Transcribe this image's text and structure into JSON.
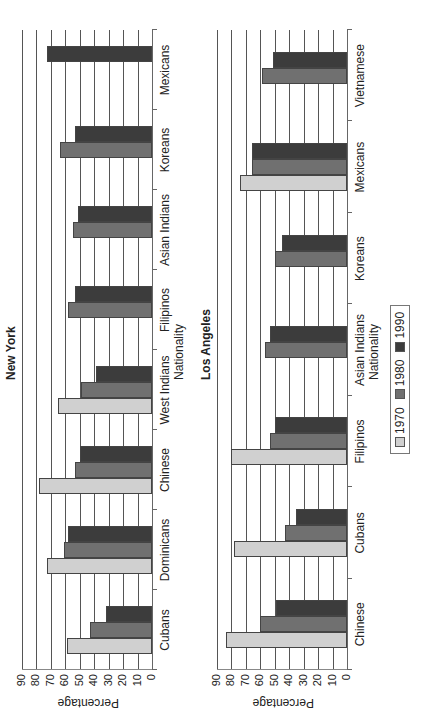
{
  "chart_data": [
    {
      "type": "bar",
      "orientation": "vertical (image rotated 90° counter-clockwise)",
      "title": "New York",
      "xlabel": "Nationality",
      "ylabel": "Percentage",
      "ylim": [
        0,
        90
      ],
      "yticks": [
        0,
        10,
        20,
        30,
        40,
        50,
        60,
        70,
        80,
        90
      ],
      "grid": true,
      "categories": [
        "Cubans",
        "Dominicans",
        "Chinese",
        "West Indians",
        "Filipinos",
        "Asian Indians",
        "Koreans",
        "Mexicans"
      ],
      "series": [
        {
          "name": "1970",
          "color": "#d0d0d0",
          "values": [
            59,
            73,
            78,
            65,
            null,
            null,
            null,
            null
          ]
        },
        {
          "name": "1980",
          "color": "#707070",
          "values": [
            43,
            61,
            53,
            49,
            58,
            55,
            64,
            null
          ]
        },
        {
          "name": "1990",
          "color": "#3c3c3c",
          "values": [
            32,
            58,
            50,
            39,
            53,
            51,
            53,
            73
          ]
        }
      ]
    },
    {
      "type": "bar",
      "orientation": "vertical (image rotated 90° counter-clockwise)",
      "title": "Los Angeles",
      "xlabel": "Nationality",
      "ylabel": "Percentage",
      "ylim": [
        0,
        90
      ],
      "yticks": [
        0,
        10,
        20,
        30,
        40,
        50,
        60,
        70,
        80,
        90
      ],
      "grid": true,
      "categories": [
        "Chinese",
        "Cubans",
        "Filipinos",
        "Asian Indians",
        "Koreans",
        "Mexicans",
        "Vietnamese"
      ],
      "series": [
        {
          "name": "1970",
          "color": "#d0d0d0",
          "values": [
            84,
            78,
            80,
            null,
            null,
            74,
            null
          ]
        },
        {
          "name": "1980",
          "color": "#707070",
          "values": [
            60,
            43,
            53,
            57,
            50,
            66,
            59
          ]
        },
        {
          "name": "1990",
          "color": "#3c3c3c",
          "values": [
            49,
            35,
            50,
            53,
            45,
            66,
            51
          ]
        }
      ]
    }
  ],
  "legend": {
    "position": "bottom",
    "items": [
      {
        "label": "1970",
        "color": "#d0d0d0"
      },
      {
        "label": "1980",
        "color": "#707070"
      },
      {
        "label": "1990",
        "color": "#3c3c3c"
      }
    ]
  }
}
